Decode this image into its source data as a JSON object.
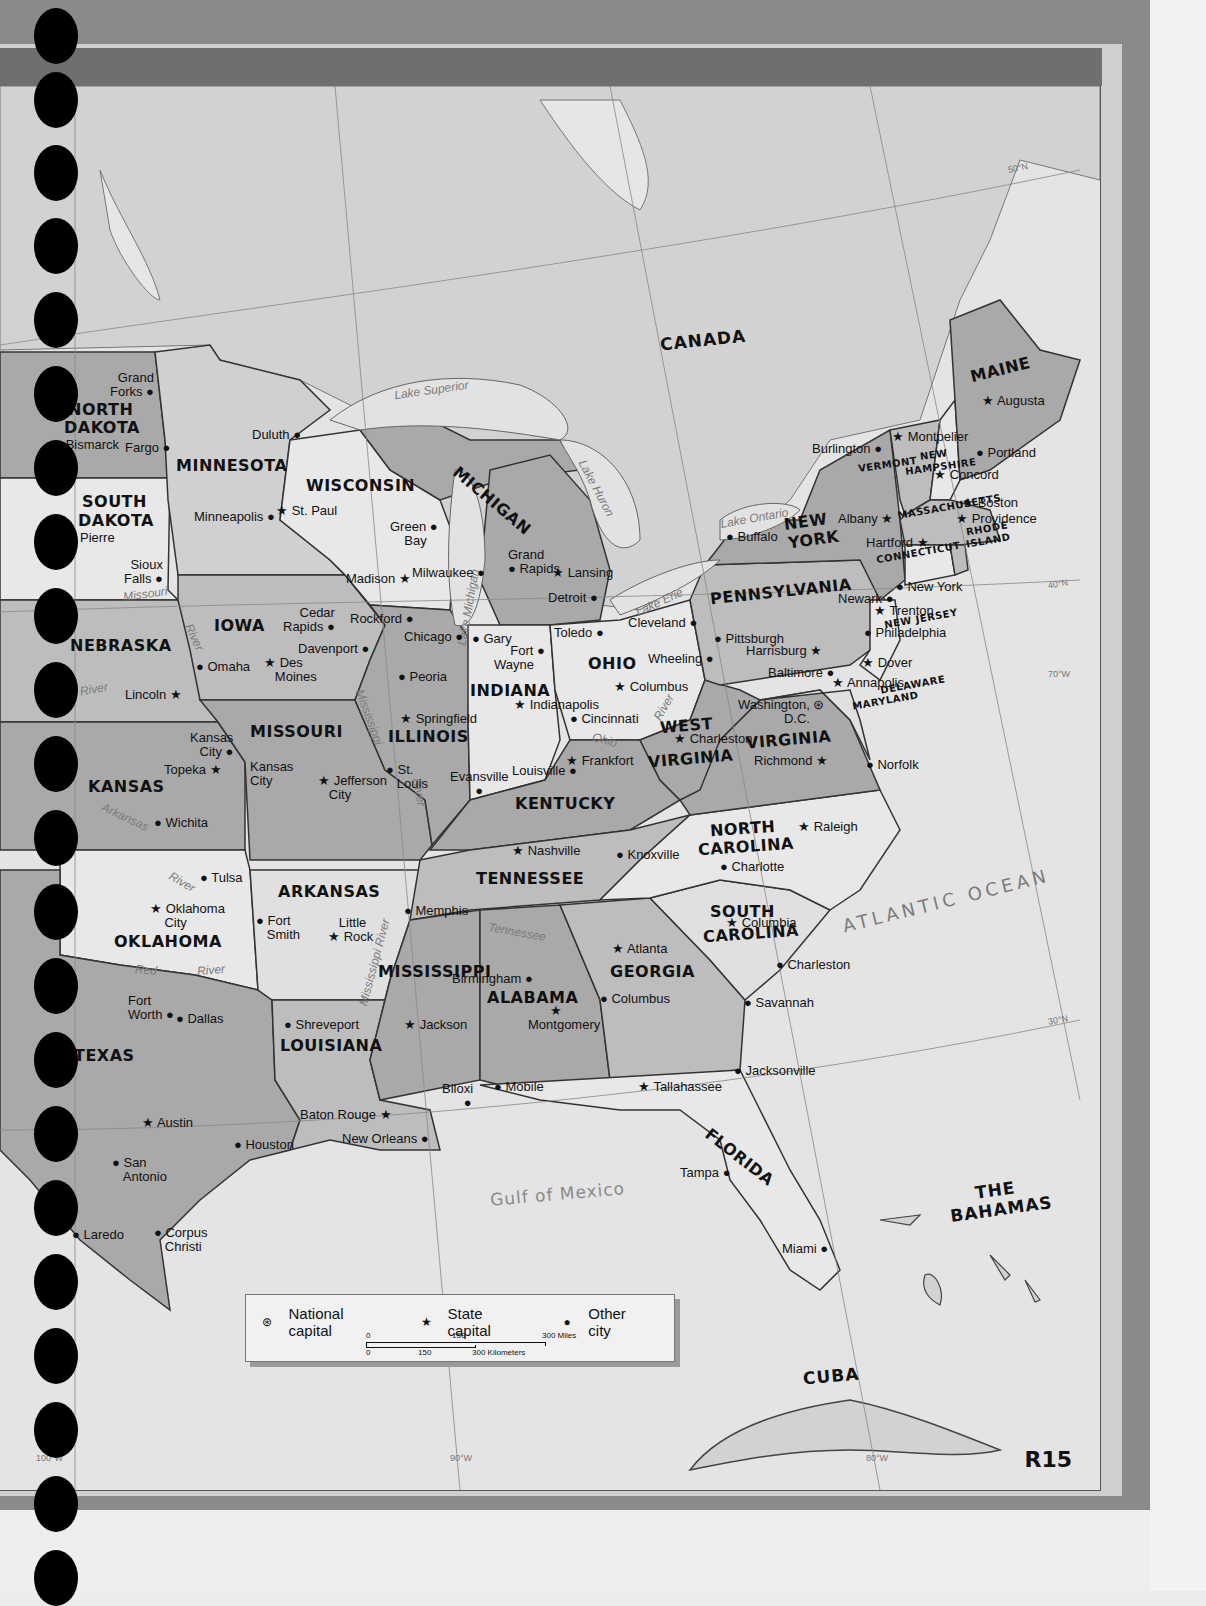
{
  "page": {
    "page_number": "R15",
    "colors": {
      "dark_state": "#a9a9a9",
      "mid_state": "#bdbdbd",
      "light_state": "#e6e6e6",
      "foreign_land": "#d3d3d3",
      "water": "#e9e9e9",
      "border": "#333333",
      "header_band": "#6f6f6f"
    }
  },
  "map": {
    "countries": [
      {
        "name": "CANADA"
      },
      {
        "name": "THE BAHAMAS"
      },
      {
        "name": "CUBA"
      }
    ],
    "water_bodies": {
      "ocean": "ATLANTIC OCEAN",
      "gulf": "Gulf of Mexico",
      "lakes": [
        "Lake Superior",
        "Lake Michigan",
        "Lake Huron",
        "Lake Erie",
        "Lake Ontario"
      ],
      "rivers": [
        "Missouri",
        "River",
        "River",
        "Mississippi River",
        "Ohio",
        "River",
        "Arkansas",
        "River",
        "Red",
        "River",
        "Tennessee",
        "Mississippi River",
        "Platte River"
      ]
    },
    "grid_labels": {
      "lat_50": "50°N",
      "lat_40": "40°N",
      "lat_30": "30°N",
      "lon_70": "70°W",
      "lon_100": "100°W",
      "lon_90": "90°W",
      "lon_80": "80°W"
    },
    "states": [
      {
        "name": "NORTH DAKOTA"
      },
      {
        "name": "SOUTH DAKOTA"
      },
      {
        "name": "NEBRASKA"
      },
      {
        "name": "KANSAS"
      },
      {
        "name": "OKLAHOMA"
      },
      {
        "name": "TEXAS"
      },
      {
        "name": "MINNESOTA"
      },
      {
        "name": "IOWA"
      },
      {
        "name": "MISSOURI"
      },
      {
        "name": "ARKANSAS"
      },
      {
        "name": "LOUISIANA"
      },
      {
        "name": "WISCONSIN"
      },
      {
        "name": "ILLINOIS"
      },
      {
        "name": "MICHIGAN"
      },
      {
        "name": "INDIANA"
      },
      {
        "name": "OHIO"
      },
      {
        "name": "KENTUCKY"
      },
      {
        "name": "TENNESSEE"
      },
      {
        "name": "MISSISSIPPI"
      },
      {
        "name": "ALABAMA"
      },
      {
        "name": "GEORGIA"
      },
      {
        "name": "FLORIDA"
      },
      {
        "name": "SOUTH CAROLINA"
      },
      {
        "name": "NORTH CAROLINA"
      },
      {
        "name": "VIRGINIA"
      },
      {
        "name": "WEST VIRGINIA"
      },
      {
        "name": "PENNSYLVANIA"
      },
      {
        "name": "NEW YORK"
      },
      {
        "name": "VERMONT"
      },
      {
        "name": "NEW HAMPSHIRE"
      },
      {
        "name": "MAINE"
      },
      {
        "name": "MASSACHUSETTS"
      },
      {
        "name": "CONNECTICUT"
      },
      {
        "name": "RHODE ISLAND"
      },
      {
        "name": "NEW JERSEY"
      },
      {
        "name": "DELAWARE"
      },
      {
        "name": "MARYLAND"
      }
    ],
    "cities": {
      "national_capital": [
        "Washington, D.C."
      ],
      "state_capitals": [
        "Bismarck",
        "Pierre",
        "Lincoln",
        "Topeka",
        "Oklahoma City",
        "Austin",
        "St. Paul",
        "Des Moines",
        "Jefferson City",
        "Little Rock",
        "Baton Rouge",
        "Madison",
        "Springfield",
        "Lansing",
        "Indianapolis",
        "Columbus",
        "Frankfort",
        "Nashville",
        "Jackson",
        "Montgomery",
        "Atlanta",
        "Tallahassee",
        "Columbia",
        "Raleigh",
        "Richmond",
        "Charleston",
        "Harrisburg",
        "Albany",
        "Montpelier",
        "Concord",
        "Augusta",
        "Boston",
        "Hartford",
        "Providence",
        "Trenton",
        "Dover",
        "Annapolis"
      ],
      "other_cities": [
        "Grand Forks",
        "Fargo",
        "Sioux Falls",
        "Omaha",
        "Kansas City",
        "Kansas City",
        "Wichita",
        "Tulsa",
        "Fort Worth",
        "Dallas",
        "San Antonio",
        "Houston",
        "Laredo",
        "Corpus Christi",
        "Duluth",
        "Minneapolis",
        "Cedar Rapids",
        "Davenport",
        "St. Louis",
        "Fort Smith",
        "Shreveport",
        "New Orleans",
        "Green Bay",
        "Milwaukee",
        "Rockford",
        "Chicago",
        "Peoria",
        "Grand Rapids",
        "Detroit",
        "Gary",
        "Fort Wayne",
        "Evansville",
        "Louisville",
        "Toledo",
        "Cleveland",
        "Cincinnati",
        "Wheeling",
        "Memphis",
        "Knoxville",
        "Biloxi",
        "Mobile",
        "Birmingham",
        "Columbus",
        "Savannah",
        "Jacksonville",
        "Tampa",
        "Miami",
        "Charlotte",
        "Charleston",
        "Norfolk",
        "Baltimore",
        "Pittsburgh",
        "Philadelphia",
        "Newark",
        "New York",
        "Buffalo",
        "Burlington",
        "Portland"
      ]
    }
  },
  "labels": {
    "canada": "CANADA",
    "bahamas_1": "THE",
    "bahamas_2": "BAHAMAS",
    "cuba": "CUBA",
    "atlantic": "ATLANTIC OCEAN",
    "gulf": "Gulf of Mexico",
    "lake_superior": "Lake Superior",
    "lake_michigan": "Lake Michigan",
    "lake_huron": "Lake Huron",
    "lake_erie": "Lake Erie",
    "lake_ontario": "Lake Ontario",
    "missouri_river": "Missouri",
    "river_a": "River",
    "platte_river": "e River",
    "mississippi_river_1": "Mississippi",
    "river_b": "River",
    "ohio_river": "Ohio",
    "river_c": "River",
    "arkansas_river": "Arkansas",
    "river_d": "River",
    "red_river_1": "Red",
    "red_river_2": "River",
    "tennessee_river": "Tennessee",
    "mississippi_river_2": "Mississippi River",
    "lat_50": "50°N",
    "lat_40": "40°N",
    "lat_30": "30°N",
    "lon_70": "70°W",
    "lon_100": "100°W",
    "lon_90": "90°W",
    "lon_80": "80°W",
    "nd_1": "NORTH",
    "nd_2": "DAKOTA",
    "sd_1": "SOUTH",
    "sd_2": "DAKOTA",
    "nebraska": "NEBRASKA",
    "kansas": "KANSAS",
    "oklahoma": "OKLAHOMA",
    "texas": "TEXAS",
    "minnesota": "MINNESOTA",
    "iowa": "IOWA",
    "missouri": "MISSOURI",
    "arkansas": "ARKANSAS",
    "louisiana": "LOUISIANA",
    "wisconsin": "WISCONSIN",
    "illinois": "ILLINOIS",
    "michigan": "MICHIGAN",
    "indiana": "INDIANA",
    "ohio": "OHIO",
    "kentucky": "KENTUCKY",
    "tennessee": "TENNESSEE",
    "mississippi": "MISSISSIPPI",
    "alabama": "ALABAMA",
    "georgia": "GEORGIA",
    "florida": "FLORIDA",
    "sc_1": "SOUTH",
    "sc_2": "CAROLINA",
    "nc_1": "NORTH",
    "nc_2": "CAROLINA",
    "virginia": "VIRGINIA",
    "wv_1": "WEST",
    "wv_2": "VIRGINIA",
    "pennsylvania": "PENNSYLVANIA",
    "ny_1": "NEW",
    "ny_2": "YORK",
    "vermont": "VERMONT",
    "nh_1": "NEW",
    "nh_2": "HAMPSHIRE",
    "maine": "MAINE",
    "massachusetts": "MASSACHUSETTS",
    "connecticut": "CONNECTICUT",
    "ri_1": "RHODE",
    "ri_2": "ISLAND",
    "new_jersey": "NEW JERSEY",
    "delaware": "DELAWARE",
    "maryland": "MARYLAND",
    "c_grand_forks_1": "Grand",
    "c_grand_forks_2": "Forks",
    "c_bismarck": "Bismarck",
    "c_fargo": "Fargo",
    "c_pierre": "Pierre",
    "c_sioux_1": "Sioux",
    "c_sioux_2": "Falls",
    "c_omaha": "Omaha",
    "c_lincoln": "Lincoln",
    "c_kc1_1": "Kansas",
    "c_kc1_2": "City",
    "c_kc2_1": "Kansas",
    "c_kc2_2": "City",
    "c_topeka": "Topeka",
    "c_wichita": "Wichita",
    "c_tulsa": "Tulsa",
    "c_okc_1": "Oklahoma",
    "c_okc_2": "City",
    "c_fw_1": "Fort",
    "c_fw_2": "Worth",
    "c_dallas": "Dallas",
    "c_austin": "Austin",
    "c_sa_1": "San",
    "c_sa_2": "Antonio",
    "c_houston": "Houston",
    "c_laredo": "Laredo",
    "c_cc_1": "Corpus",
    "c_cc_2": "Christi",
    "c_duluth": "Duluth",
    "c_minneapolis": "Minneapolis",
    "c_stpaul": "St. Paul",
    "c_cr_1": "Cedar",
    "c_cr_2": "Rapids",
    "c_davenport": "Davenport",
    "c_dm_1": "Des",
    "c_dm_2": "Moines",
    "c_jc_1": "Jefferson",
    "c_jc_2": "City",
    "c_stl_1": "St.",
    "c_stl_2": "Louis",
    "c_fs_1": "Fort",
    "c_fs_2": "Smith",
    "c_lr_1": "Little",
    "c_lr_2": "Rock",
    "c_shreveport": "Shreveport",
    "c_batonrouge": "Baton Rouge",
    "c_neworleans": "New Orleans",
    "c_gb_1": "Green",
    "c_gb_2": "Bay",
    "c_madison": "Madison",
    "c_milwaukee": "Milwaukee",
    "c_rockford": "Rockford",
    "c_chicago": "Chicago",
    "c_peoria": "Peoria",
    "c_springfield": "Springfield",
    "c_grr_1": "Grand",
    "c_grr_2": "Rapids",
    "c_lansing": "Lansing",
    "c_detroit": "Detroit",
    "c_gary": "Gary",
    "c_fwayne_1": "Fort",
    "c_fwayne_2": "Wayne",
    "c_indianapolis": "Indianapolis",
    "c_evansville": "Evansville",
    "c_louisville": "Louisville",
    "c_frankfort": "Frankfort",
    "c_toledo": "Toledo",
    "c_cleveland": "Cleveland",
    "c_columbus_oh": "Columbus",
    "c_cincinnati": "Cincinnati",
    "c_wheeling": "Wheeling",
    "c_charleston_wv": "Charleston",
    "c_memphis": "Memphis",
    "c_nashville": "Nashville",
    "c_knoxville": "Knoxville",
    "c_jackson": "Jackson",
    "c_biloxi": "Biloxi",
    "c_mobile": "Mobile",
    "c_birmingham": "Birmingham",
    "c_montgomery": "Montgomery",
    "c_atlanta": "Atlanta",
    "c_columbus_ga": "Columbus",
    "c_savannah": "Savannah",
    "c_tallahassee": "Tallahassee",
    "c_jacksonville": "Jacksonville",
    "c_tampa": "Tampa",
    "c_miami": "Miami",
    "c_columbia": "Columbia",
    "c_charleston_sc": "Charleston",
    "c_raleigh": "Raleigh",
    "c_charlotte": "Charlotte",
    "c_richmond": "Richmond",
    "c_norfolk": "Norfolk",
    "c_washington_1": "Washington,",
    "c_washington_2": "D.C.",
    "c_baltimore": "Baltimore",
    "c_annapolis": "Annapolis",
    "c_dover": "Dover",
    "c_pittsburgh": "Pittsburgh",
    "c_harrisburg": "Harrisburg",
    "c_philadelphia": "Philadelphia",
    "c_trenton": "Trenton",
    "c_newark": "Newark",
    "c_newyork": "New York",
    "c_buffalo": "Buffalo",
    "c_albany": "Albany",
    "c_burlington": "Burlington",
    "c_montpelier": "Montpelier",
    "c_concord": "Concord",
    "c_augusta": "Augusta",
    "c_portland": "Portland",
    "c_boston": "Boston",
    "c_providence": "Providence",
    "c_hartford": "Hartford"
  },
  "legend": {
    "items": [
      {
        "symbol": "⊛",
        "label": "National capital"
      },
      {
        "symbol": "★",
        "label": "State capital"
      },
      {
        "symbol": "●",
        "label": "Other city"
      }
    ],
    "scale": {
      "miles_ticks": [
        "0",
        "150",
        "300 Miles"
      ],
      "km_ticks": [
        "0",
        "150",
        "300 Kilometers"
      ]
    }
  }
}
